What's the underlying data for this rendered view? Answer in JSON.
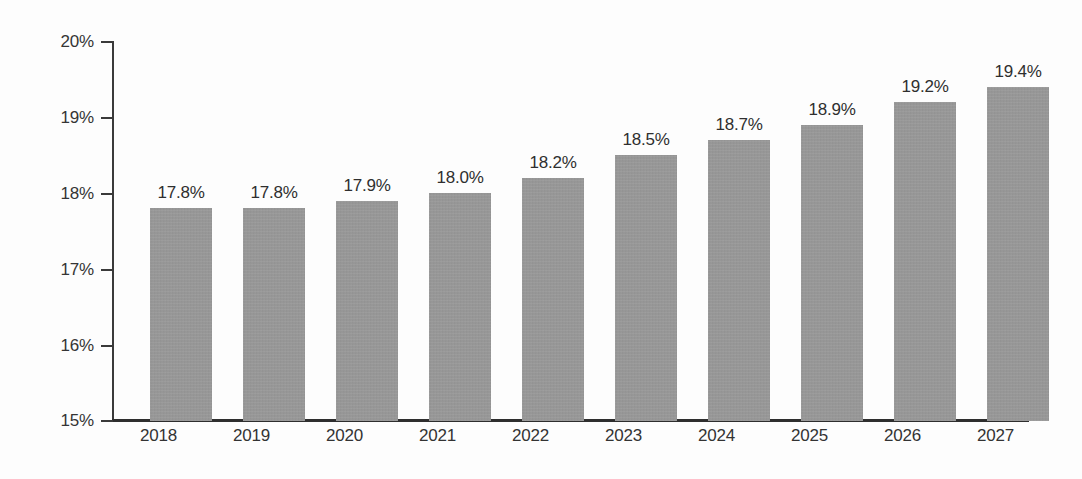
{
  "chart_data": {
    "type": "bar",
    "title": "",
    "subtitle": "",
    "xlabel": "",
    "ylabel": "",
    "categories": [
      "2018",
      "2019",
      "2020",
      "2021",
      "2022",
      "2023",
      "2024",
      "2025",
      "2026",
      "2027"
    ],
    "values": [
      17.8,
      17.8,
      17.9,
      18.0,
      18.2,
      18.5,
      18.7,
      18.9,
      19.2,
      19.4
    ],
    "data_labels": [
      "17.8%",
      "17.8%",
      "17.9%",
      "18.0%",
      "18.2%",
      "18.5%",
      "18.7%",
      "18.9%",
      "19.2%",
      "19.4%"
    ],
    "ylim": [
      15,
      20
    ],
    "ytick_values": [
      20,
      19,
      18,
      17,
      16,
      15
    ],
    "ytick_labels": [
      "20%",
      "19%",
      "18%",
      "17%",
      "16%",
      "15%"
    ],
    "grid": false,
    "legend": null,
    "legend_position": "none",
    "series_name": "",
    "bar_color": "#9a9a9a",
    "axis_color": "#3a3a3a",
    "text_color": "#333333",
    "background_color": "#fdfdfd",
    "value_unit": "%"
  }
}
